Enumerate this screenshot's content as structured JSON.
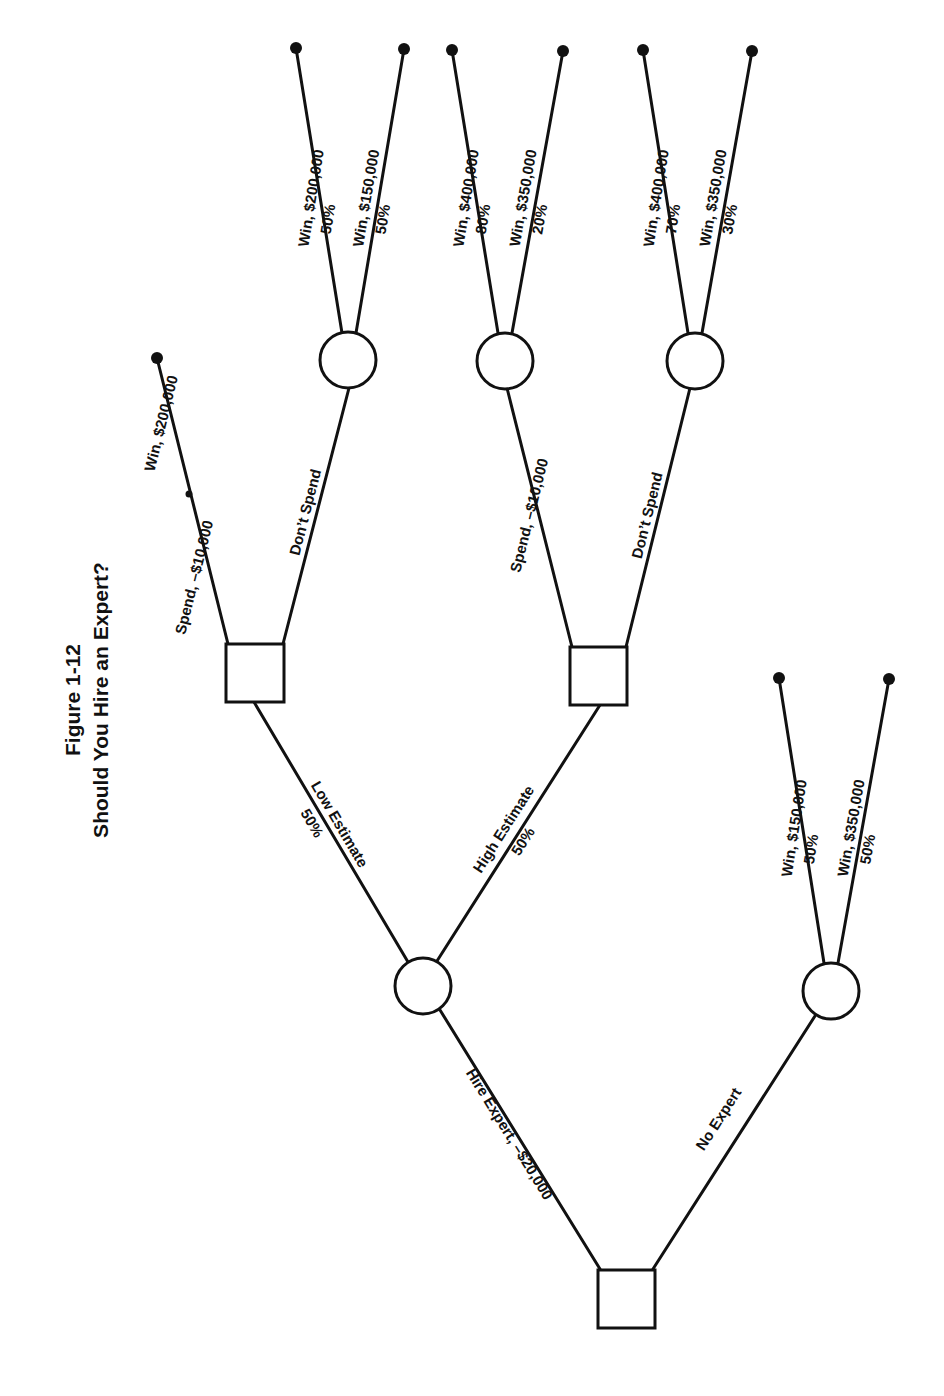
{
  "title": {
    "line1": "Figure 1-12",
    "line2": "Should You Hire an Expert?"
  },
  "colors": {
    "ink": "#111111",
    "background": "#ffffff"
  },
  "nodes": {
    "root_decision": {
      "type": "decision",
      "shape": "square"
    },
    "expert_chance": {
      "type": "chance",
      "shape": "circle"
    },
    "no_expert_chance": {
      "type": "chance",
      "shape": "circle"
    },
    "low_decision": {
      "type": "decision",
      "shape": "square"
    },
    "high_decision": {
      "type": "decision",
      "shape": "square"
    },
    "low_dont_spend_chance": {
      "type": "chance",
      "shape": "circle"
    },
    "high_spend_chance": {
      "type": "chance",
      "shape": "circle"
    },
    "high_dont_spend_chance": {
      "type": "chance",
      "shape": "circle"
    }
  },
  "edges": {
    "hire_expert": "Hire Expert, –$20,000",
    "no_expert": "No Expert",
    "low_estimate": "Low Estimate",
    "low_estimate_prob": "50%",
    "high_estimate": "High Estimate",
    "high_estimate_prob": "50%",
    "low_spend": "Spend, –$10,000",
    "low_spend_win": "Win, $200,000",
    "low_dont_spend": "Don’t Spend",
    "low_ds_win1": "Win, $200,000",
    "low_ds_win1_prob": "50%",
    "low_ds_win2": "Win, $150,000",
    "low_ds_win2_prob": "50%",
    "high_spend": "Spend, –$10,000",
    "high_spend_win1": "Win, $400,000",
    "high_spend_win1_prob": "80%",
    "high_spend_win2": "Win, $350,000",
    "high_spend_win2_prob": "20%",
    "high_dont_spend": "Don’t Spend",
    "high_ds_win1": "Win, $400,000",
    "high_ds_win1_prob": "70%",
    "high_ds_win2": "Win, $350,000",
    "high_ds_win2_prob": "30%",
    "ne_win1": "Win, $150,000",
    "ne_win1_prob": "50%",
    "ne_win2": "Win, $350,000",
    "ne_win2_prob": "50%"
  }
}
